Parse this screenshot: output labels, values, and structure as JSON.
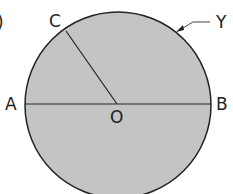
{
  "diagram": {
    "part_marker": ")",
    "labels": {
      "A": "A",
      "B": "B",
      "C": "C",
      "O": "O",
      "Y": "Y"
    },
    "colors": {
      "fill": "#c4c4c4",
      "stroke": "#222222"
    }
  }
}
